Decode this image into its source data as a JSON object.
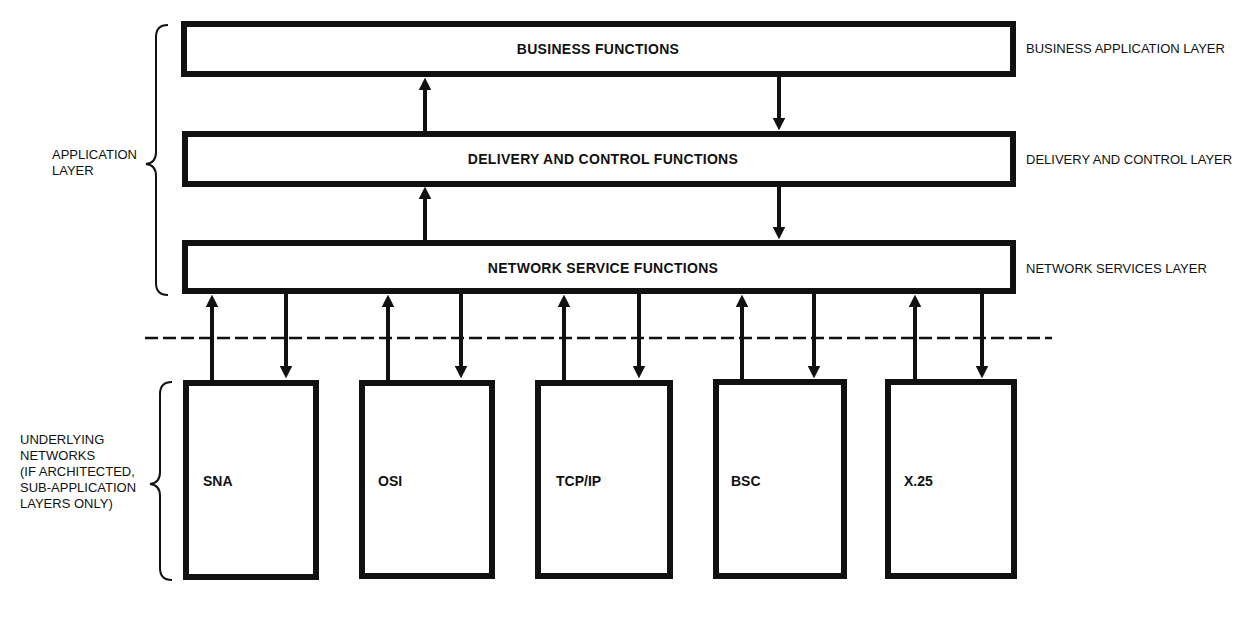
{
  "layers": [
    {
      "box_label": "BUSINESS FUNCTIONS",
      "side_label": "BUSINESS APPLICATION LAYER"
    },
    {
      "box_label": "DELIVERY AND CONTROL FUNCTIONS",
      "side_label": "DELIVERY AND CONTROL LAYER"
    },
    {
      "box_label": "NETWORK SERVICE FUNCTIONS",
      "side_label": "NETWORK SERVICES LAYER"
    }
  ],
  "group_labels": {
    "application": [
      "APPLICATION",
      "LAYER"
    ],
    "underlying": [
      "UNDERLYING",
      "NETWORKS",
      "(IF ARCHITECTED,",
      "SUB-APPLICATION",
      "LAYERS ONLY)"
    ]
  },
  "networks": [
    {
      "label": "SNA"
    },
    {
      "label": "OSI"
    },
    {
      "label": "TCP/IP"
    },
    {
      "label": "BSC"
    },
    {
      "label": "X.25"
    }
  ],
  "colors": {
    "stroke": "#111111",
    "background": "#ffffff"
  }
}
